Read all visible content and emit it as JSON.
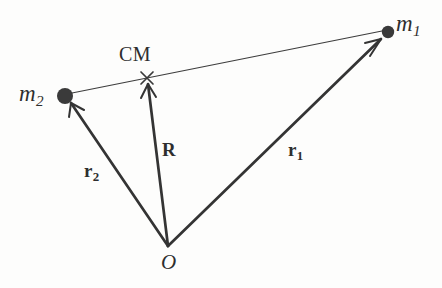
{
  "figure": {
    "background_color": "#fdfdfc",
    "ink_color": "#333333"
  },
  "points": {
    "origin": {
      "label": "O",
      "x": 168,
      "y": 246
    },
    "mass1": {
      "label": "m",
      "subscript": "1",
      "x": 388,
      "y": 32,
      "marker": "filled-circle",
      "radius": 6
    },
    "mass2": {
      "label": "m",
      "subscript": "2",
      "x": 65,
      "y": 96,
      "marker": "filled-circle",
      "radius": 7.5
    },
    "center_of_mass": {
      "label": "CM",
      "x": 147,
      "y": 78,
      "marker": "cross-x"
    }
  },
  "vectors": [
    {
      "name": "r1",
      "label": "r",
      "subscript": "1",
      "from": "origin",
      "to": "mass1",
      "x1": 168,
      "y1": 246,
      "x2": 384,
      "y2": 37,
      "arrowhead": true,
      "stroke_width": 2.6
    },
    {
      "name": "r2",
      "label": "r",
      "subscript": "2",
      "from": "origin",
      "to": "mass2",
      "x1": 168,
      "y1": 246,
      "x2": 70,
      "y2": 104,
      "arrowhead": true,
      "stroke_width": 2.6
    },
    {
      "name": "R",
      "label": "R",
      "subscript": "",
      "from": "origin",
      "to": "center_of_mass",
      "x1": 168,
      "y1": 246,
      "x2": 148,
      "y2": 84,
      "arrowhead": true,
      "stroke_width": 2.6
    }
  ],
  "connector": {
    "name": "m2-to-m1-line",
    "x1": 72,
    "y1": 93,
    "x2": 382,
    "y2": 31,
    "stroke_width": 1.1,
    "arrowhead": false
  },
  "labels": {
    "m1": "m",
    "m1_sub": "1",
    "m2": "m",
    "m2_sub": "2",
    "cm": "CM",
    "origin": "O",
    "vec_R": "R",
    "vec_r1": "r",
    "vec_r1_sub": "1",
    "vec_r2": "r",
    "vec_r2_sub": "2"
  }
}
